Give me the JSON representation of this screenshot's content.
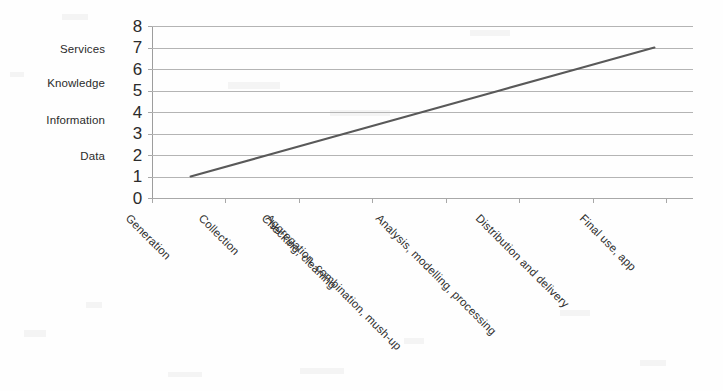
{
  "chart_data": {
    "type": "line",
    "title": "",
    "subtitle": "",
    "xlabel": "",
    "ylabel": "",
    "ylim": [
      0,
      8
    ],
    "yticks": [
      "8",
      "7",
      "6",
      "5",
      "4",
      "3",
      "2",
      "1",
      "0"
    ],
    "grid": true,
    "legend": "none",
    "categories": [
      "Generation",
      "Collection",
      "Checking, cleaning",
      "Aggregation, combination, mush-up",
      "Analysis, modelling, processing",
      "Distribution and delivery",
      "Final use, app"
    ],
    "values": [
      1,
      2,
      3,
      4,
      5,
      6,
      7
    ],
    "series": [
      {
        "name": "value chain",
        "values": [
          1,
          2,
          3,
          4,
          5,
          6,
          7
        ],
        "color": "#595959"
      }
    ],
    "value_tier_annotations": [
      {
        "label": "Services",
        "y_value": 7
      },
      {
        "label": "Knowledge",
        "y_value": 6
      },
      {
        "label": "Information",
        "y_value": 4
      },
      {
        "label": "Data",
        "y_value": 2
      }
    ]
  },
  "colors": {
    "series_line": "#595959",
    "gridline": "#b4b4b4",
    "axis": "#a0a0a0",
    "text": "#2b2b2b",
    "background": "#fefefe"
  }
}
